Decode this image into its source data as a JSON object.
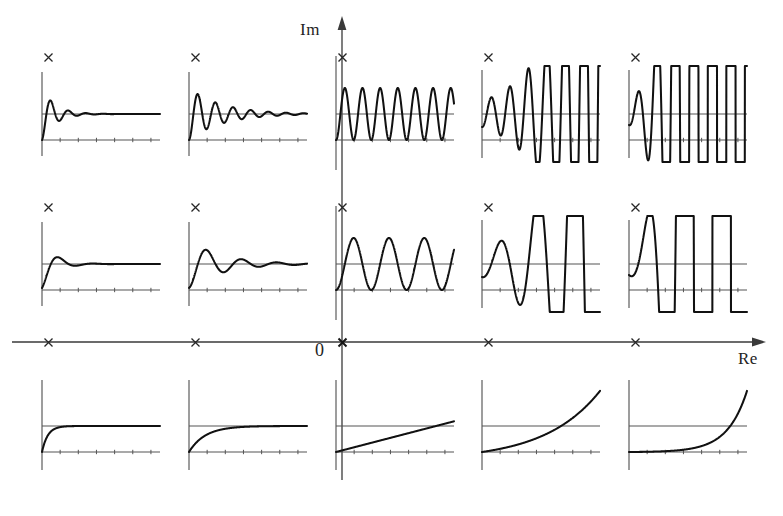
{
  "figure": {
    "axis": {
      "imaginary_label": "Im",
      "real_label": "Re",
      "origin_label": "0"
    },
    "colors": {
      "curve": "#111111",
      "axis": "#3a3a3a",
      "panel_axis": "#555555",
      "background": "#ffffff"
    }
  },
  "chart_data": {
    "type": "line",
    "xlabel": "Re",
    "ylabel": "Im",
    "grid": false,
    "legend": "none",
    "plane": {
      "real_axis_pole_x_positions": [
        48,
        195,
        342,
        488,
        635
      ],
      "imag_axis_row_y_positions": [
        57,
        207,
        342
      ],
      "origin_pixel": [
        342,
        342
      ]
    },
    "rows": [
      {
        "row": 1,
        "imag_part": "high",
        "damping_row_label": "high natural frequency",
        "panels": [
          {
            "col": 1,
            "pole": {
              "re": -2.0,
              "im": 3.0
            },
            "response": "heavily damped high-frequency oscillation settling quickly to steady state",
            "envelope": "decaying",
            "cycles": 4.5,
            "damping_ratio": 0.3,
            "omega": 42,
            "decay": 9.0,
            "stable": true
          },
          {
            "col": 2,
            "pole": {
              "re": -1.0,
              "im": 3.0
            },
            "response": "lightly damped high-frequency oscillation, many visible cycles decaying slowly",
            "envelope": "decaying",
            "cycles": 6.0,
            "damping_ratio": 0.12,
            "omega": 42,
            "decay": 3.6,
            "stable": true
          },
          {
            "col": 3,
            "pole": {
              "re": 0.0,
              "im": 3.0
            },
            "response": "undamped sustained oscillation of constant amplitude (pole on imaginary axis)",
            "envelope": "constant",
            "cycles": 6.0,
            "damping_ratio": 0.0,
            "omega": 42,
            "decay": 0.0,
            "stable": false
          },
          {
            "col": 4,
            "pole": {
              "re": 1.0,
              "im": 3.0
            },
            "response": "growing oscillation, amplitude increases each cycle (unstable)",
            "envelope": "growing",
            "cycles": 5.5,
            "damping_ratio": -0.1,
            "omega": 40,
            "decay": -3.2,
            "stable": false
          },
          {
            "col": 5,
            "pole": {
              "re": 2.0,
              "im": 3.0
            },
            "response": "rapidly growing oscillation leaving the plot after a few cycles",
            "envelope": "rapidly growing",
            "cycles": 3.5,
            "damping_ratio": -0.3,
            "omega": 40,
            "decay": -9.0,
            "stable": false
          }
        ]
      },
      {
        "row": 2,
        "imag_part": "low",
        "damping_row_label": "low natural frequency",
        "panels": [
          {
            "col": 1,
            "pole": {
              "re": -2.0,
              "im": 1.5
            },
            "response": "well damped low-frequency response with small overshoot settling to steady state",
            "envelope": "decaying",
            "cycles": 2.2,
            "damping_ratio": 0.5,
            "omega": 21,
            "decay": 9.0,
            "stable": true
          },
          {
            "col": 2,
            "pole": {
              "re": -1.0,
              "im": 1.5
            },
            "response": "damped low-frequency oscillation with about three visible cycles",
            "envelope": "decaying",
            "cycles": 3.0,
            "damping_ratio": 0.2,
            "omega": 21,
            "decay": 3.6,
            "stable": true
          },
          {
            "col": 3,
            "pole": {
              "re": 0.0,
              "im": 1.5
            },
            "response": "sustained low-frequency oscillation of constant amplitude",
            "envelope": "constant",
            "cycles": 3.0,
            "damping_ratio": 0.0,
            "omega": 21,
            "decay": 0.0,
            "stable": false
          },
          {
            "col": 4,
            "pole": {
              "re": 1.0,
              "im": 1.5
            },
            "response": "growing low-frequency oscillation (unstable)",
            "envelope": "growing",
            "cycles": 2.8,
            "damping_ratio": -0.18,
            "omega": 20,
            "decay": -3.6,
            "stable": false
          },
          {
            "col": 5,
            "pole": {
              "re": 2.0,
              "im": 1.5
            },
            "response": "violently growing low-frequency oscillation off scale",
            "envelope": "rapidly growing",
            "cycles": 2.4,
            "damping_ratio": -0.45,
            "omega": 20,
            "decay": -9.5,
            "stable": false
          }
        ]
      },
      {
        "row": 3,
        "imag_part": "zero",
        "damping_row_label": "purely real poles, no oscillation",
        "panels": [
          {
            "col": 1,
            "pole": {
              "re": -2.0,
              "im": 0.0
            },
            "response": "fast exponential rise to steady state",
            "envelope": "exponential-saturating",
            "rate": 4.5,
            "stable": true
          },
          {
            "col": 2,
            "pole": {
              "re": -1.0,
              "im": 0.0
            },
            "response": "slow exponential rise approaching steady state",
            "envelope": "exponential-saturating",
            "rate": 1.6,
            "stable": true
          },
          {
            "col": 3,
            "pole": {
              "re": 0.0,
              "im": 0.0
            },
            "response": "linear ramp, integrator (pole at the origin)",
            "envelope": "linear",
            "rate": 0.0,
            "stable": false
          },
          {
            "col": 4,
            "pole": {
              "re": 1.0,
              "im": 0.0
            },
            "response": "slowly growing exponential (unstable)",
            "envelope": "exponential-growing",
            "rate": 1.5,
            "stable": false
          },
          {
            "col": 5,
            "pole": {
              "re": 2.0,
              "im": 0.0
            },
            "response": "rapidly growing exponential leaving the plot (unstable)",
            "envelope": "exponential-growing",
            "rate": 4.2,
            "stable": false
          }
        ]
      }
    ]
  }
}
